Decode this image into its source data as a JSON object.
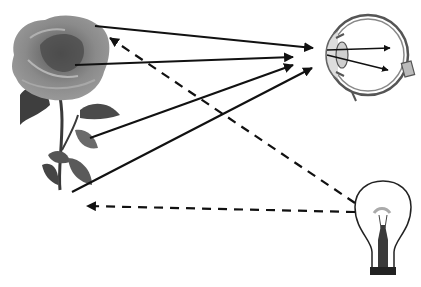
{
  "diagram": {
    "colors": {
      "background": "#ffffff",
      "arrow": "#111111",
      "petal": "#6e6e6e",
      "leaf": "#4a4a4a",
      "stem": "#3a3a3a"
    },
    "objects": [
      {
        "id": "rose",
        "icon": "rose-icon",
        "label": ""
      },
      {
        "id": "eye",
        "icon": "eye-icon",
        "label": ""
      },
      {
        "id": "bulb",
        "icon": "light-bulb-icon",
        "label": ""
      }
    ],
    "reflected_rays": [
      {
        "from": [
          95,
          26
        ],
        "to": [
          313,
          48
        ]
      },
      {
        "from": [
          75,
          65
        ],
        "to": [
          293,
          57
        ]
      },
      {
        "from": [
          90,
          138
        ],
        "to": [
          293,
          65
        ]
      },
      {
        "from": [
          72,
          192
        ],
        "to": [
          312,
          68
        ]
      }
    ],
    "incident_rays": [
      {
        "from": [
          355,
          203
        ],
        "to": [
          110,
          38
        ],
        "style": "dashed"
      },
      {
        "from": [
          355,
          212
        ],
        "to": [
          87,
          206
        ],
        "style": "dashed"
      }
    ]
  }
}
